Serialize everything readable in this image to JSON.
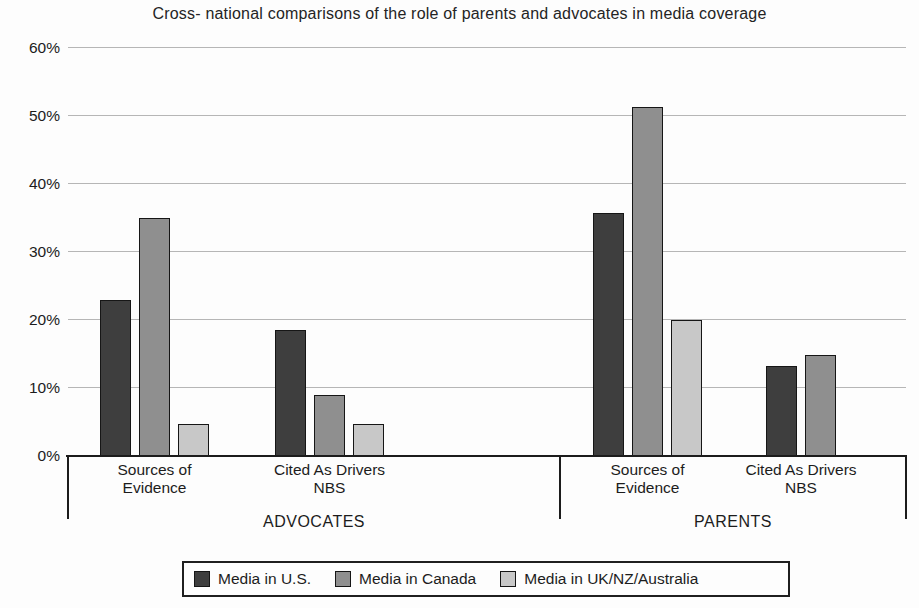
{
  "chart_data": {
    "type": "bar",
    "title": "Cross- national comparisons of the role of parents and advocates in media coverage",
    "xlabel": "",
    "ylabel": "",
    "ylim": [
      0,
      60
    ],
    "grid": true,
    "legend_position": "bottom",
    "y_ticks": [
      {
        "label": "0%",
        "value": 0
      },
      {
        "label": "10%",
        "value": 10
      },
      {
        "label": "20%",
        "value": 20
      },
      {
        "label": "30%",
        "value": 30
      },
      {
        "label": "40%",
        "value": 40
      },
      {
        "label": "50%",
        "value": 50
      },
      {
        "label": "60%",
        "value": 60
      }
    ],
    "groups": [
      {
        "label": "ADVOCATES",
        "categories": [
          "Sources of Evidence",
          "Cited As Drivers NBS"
        ]
      },
      {
        "label": "PARENTS",
        "categories": [
          "Sources of Evidence",
          "Cited As Drivers NBS"
        ]
      }
    ],
    "categories_flat": [
      "Sources of Evidence",
      "Cited As Drivers NBS",
      "Sources of Evidence",
      "Cited As Drivers NBS"
    ],
    "series": [
      {
        "name": "Media in U.S.",
        "color": "#3e3e3e",
        "values": [
          23,
          18.5,
          35.7,
          13.3
        ]
      },
      {
        "name": "Media in Canada",
        "color": "#8f8f8f",
        "values": [
          35,
          9,
          51.3,
          14.8
        ]
      },
      {
        "name": "Media in UK/NZ/Australia",
        "color": "#c8c8c8",
        "values": [
          4.7,
          4.7,
          20,
          null
        ]
      }
    ]
  },
  "colors": {
    "text": "#1c1c1c",
    "gridline": "#a9a9a9",
    "axis": "#1c1c1c",
    "background": "#fdfdfd"
  }
}
